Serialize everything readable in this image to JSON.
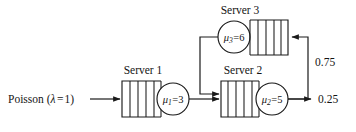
{
  "diagram": {
    "type": "queueing-network",
    "background_color": "#ffffff",
    "line_color": "#1a1a1a",
    "source": {
      "label_prefix": "Poisson (",
      "label_lambda": "λ",
      "label_equals": "=",
      "label_rate": "1",
      "label_suffix": ")",
      "full_label": "Poisson (λ = 1)"
    },
    "servers": [
      {
        "id": "server-1",
        "title": "Server 1",
        "mu_symbol": "μ",
        "mu_index": "1",
        "mu_value": "3",
        "rate_label": "μ₁=3",
        "queue_slots": 4,
        "orientation": "queue-left-circle-right"
      },
      {
        "id": "server-2",
        "title": "Server 2",
        "mu_symbol": "μ",
        "mu_index": "2",
        "mu_value": "5",
        "rate_label": "μ₂=5",
        "queue_slots": 4,
        "orientation": "queue-left-circle-right"
      },
      {
        "id": "server-3",
        "title": "Server 3",
        "mu_symbol": "μ",
        "mu_index": "3",
        "mu_value": "6",
        "rate_label": "μ₃=6",
        "queue_slots": 4,
        "orientation": "circle-left-queue-right"
      }
    ],
    "routing": [
      {
        "id": "feedback-branch",
        "probability": "0.75",
        "from": "server-2",
        "to": "server-3",
        "description": "feedback to Server 3"
      },
      {
        "id": "departure-branch",
        "probability": "0.25",
        "from": "server-2",
        "to": "exit",
        "description": "departure from system"
      }
    ],
    "probabilities": {
      "feedback": "0.75",
      "departure": "0.25"
    }
  }
}
